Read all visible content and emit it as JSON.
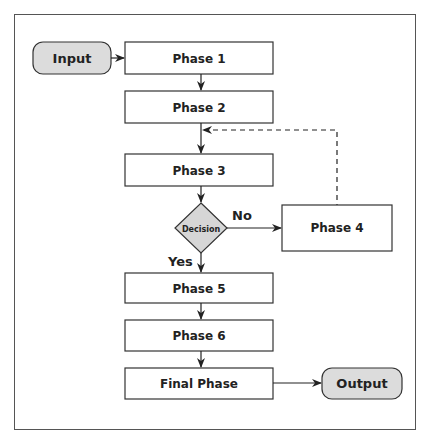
{
  "diagram": {
    "type": "flowchart",
    "colors": {
      "border": "#333333",
      "terminal_fill": "#dcdcdc",
      "decision_fill": "#d6d6d6",
      "box_fill": "#ffffff",
      "frame": "#555555"
    },
    "nodes": {
      "input": "Input",
      "phase1": "Phase 1",
      "phase2": "Phase 2",
      "phase3": "Phase 3",
      "decision": "Decision",
      "phase4": "Phase 4",
      "phase5": "Phase 5",
      "phase6": "Phase 6",
      "final": "Final Phase",
      "output": "Output"
    },
    "edge_labels": {
      "no": "No",
      "yes": "Yes"
    },
    "edges": [
      {
        "from": "input",
        "to": "phase1"
      },
      {
        "from": "phase1",
        "to": "phase2"
      },
      {
        "from": "phase2",
        "to": "phase3"
      },
      {
        "from": "phase3",
        "to": "decision"
      },
      {
        "from": "decision",
        "to": "phase4",
        "label": "No"
      },
      {
        "from": "decision",
        "to": "phase5",
        "label": "Yes"
      },
      {
        "from": "phase4",
        "to": "phase3",
        "style": "dashed"
      },
      {
        "from": "phase5",
        "to": "phase6"
      },
      {
        "from": "phase6",
        "to": "final"
      },
      {
        "from": "final",
        "to": "output"
      }
    ]
  }
}
